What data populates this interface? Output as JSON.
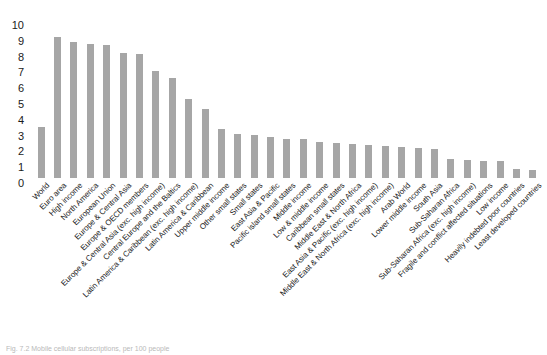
{
  "chart_data": {
    "type": "bar",
    "title": "",
    "subtitle": "",
    "xlabel": "",
    "ylabel": "",
    "ylim": [
      0,
      10
    ],
    "yticks": [
      0,
      1,
      2,
      3,
      4,
      5,
      6,
      7,
      8,
      9,
      10
    ],
    "grid": false,
    "legend": null,
    "bar_color": "#a6a6a6",
    "categories": [
      "World",
      "Euro area",
      "High income",
      "North America",
      "European Union",
      "Europe & Central Asia",
      "Europe & OECD members",
      "Europe & Central Asia (exc. high income)",
      "Central Europe and the Baltics",
      "Latin America & Caribbean (exc. high income)",
      "Latin America & Caribbean",
      "Upper middle income",
      "Other small states",
      "Small states",
      "East Asia & Pacific",
      "Pacific island small states",
      "Middle income",
      "Low & middle income",
      "Caribbean small states",
      "Middle East & North Africa",
      "East Asia & Pacific (exc. high income)",
      "Middle East & North Africa (exc. high income)",
      "Arab World",
      "Lower middle income",
      "South Asia",
      "Sub-Saharan Africa",
      "Sub-Saharan Africa (exc. high income)",
      "Fragile and conflict affected situations",
      "Low income",
      "Heavily indebted poor countries",
      "Least developed countries"
    ],
    "values": [
      3.2,
      8.9,
      8.6,
      8.5,
      8.4,
      7.9,
      7.85,
      6.8,
      6.35,
      5.0,
      4.35,
      3.1,
      2.8,
      2.75,
      2.6,
      2.5,
      2.45,
      2.3,
      2.2,
      2.15,
      2.1,
      2.05,
      1.95,
      1.9,
      1.85,
      1.2,
      1.15,
      1.1,
      1.05,
      0.55,
      0.5
    ]
  },
  "caption": {
    "text": "Fig. 7.2  Mobile cellular subscriptions, per 100 people"
  },
  "axis": {
    "y_tick_labels": [
      "10",
      "9",
      "8",
      "7",
      "6",
      "5",
      "4",
      "3",
      "2",
      "1",
      "0"
    ]
  }
}
